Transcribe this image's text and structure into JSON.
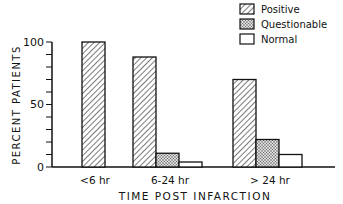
{
  "chart_data": {
    "type": "bar",
    "title": "",
    "xlabel": "TIME POST INFARCTION",
    "ylabel": "PERCENT PATIENTS",
    "ylim": [
      0,
      100
    ],
    "yticks": [
      "0",
      "50",
      "100"
    ],
    "minor_tick_step": 10,
    "grid": false,
    "legend_position": "top-right",
    "categories": [
      "<6 hr",
      "6-24 hr",
      "> 24 hr"
    ],
    "series": [
      {
        "name": "Positive",
        "pattern": "diagonal-hatch",
        "values": [
          100,
          88,
          70
        ]
      },
      {
        "name": "Questionable",
        "pattern": "stipple",
        "values": [
          0,
          11,
          22
        ]
      },
      {
        "name": "Normal",
        "pattern": "white",
        "values": [
          0,
          4,
          10
        ]
      }
    ]
  }
}
